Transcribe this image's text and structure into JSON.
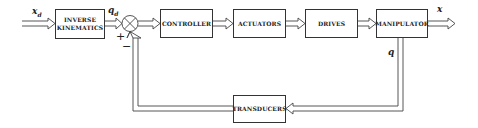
{
  "diagram": {
    "type": "block-diagram",
    "title": "",
    "blocks": [
      {
        "id": "inverse_kinematics",
        "label_line1": "INVERSE",
        "label_line2": "KINEMATICS"
      },
      {
        "id": "controller",
        "label": "CONTROLLER"
      },
      {
        "id": "actuators",
        "label": "ACTUATORS"
      },
      {
        "id": "drives",
        "label": "DRIVES"
      },
      {
        "id": "manipulator",
        "label": "MANIPULATOR"
      },
      {
        "id": "transducers",
        "label": "TRANSDUCERS"
      }
    ],
    "summing_junction": {
      "plus": "+",
      "minus": "−"
    },
    "signals": {
      "input": {
        "base": "x",
        "sub": "d"
      },
      "joint_ref": {
        "base": "q",
        "sub": "d"
      },
      "output": "x",
      "feedback": "q"
    },
    "edges": [
      {
        "from": "input",
        "to": "inverse_kinematics",
        "label": "x_d"
      },
      {
        "from": "inverse_kinematics",
        "to": "summing_junction",
        "label": "q_d",
        "sign": "+"
      },
      {
        "from": "summing_junction",
        "to": "controller"
      },
      {
        "from": "controller",
        "to": "actuators"
      },
      {
        "from": "actuators",
        "to": "drives"
      },
      {
        "from": "drives",
        "to": "manipulator"
      },
      {
        "from": "manipulator",
        "to": "output",
        "label": "x"
      },
      {
        "from": "manipulator",
        "to": "transducers",
        "label": "q"
      },
      {
        "from": "transducers",
        "to": "summing_junction",
        "sign": "−"
      }
    ]
  }
}
